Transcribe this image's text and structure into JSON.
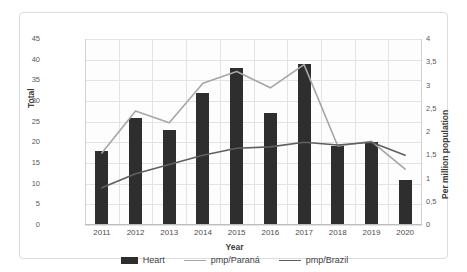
{
  "chart_data": {
    "type": "bar",
    "title": "",
    "xlabel": "Year",
    "ylabel": "Total",
    "y2label": "Per million population",
    "categories": [
      "2011",
      "2012",
      "2013",
      "2014",
      "2015",
      "2016",
      "2017",
      "2018",
      "2019",
      "2020"
    ],
    "ylim": [
      0,
      45
    ],
    "y2lim": [
      0,
      4
    ],
    "yticks": [
      "0",
      "5",
      "10",
      "15",
      "20",
      "25",
      "30",
      "35",
      "40",
      "45"
    ],
    "y2ticks": [
      "0",
      "0,5",
      "1",
      "1,5",
      "2",
      "2,5",
      "3",
      "3,5",
      "4"
    ],
    "grid": true,
    "legend_position": "bottom",
    "series": [
      {
        "name": "Heart",
        "type": "bar",
        "axis": "left",
        "color": "#2e2e2e",
        "values": [
          18,
          26,
          23,
          32,
          38,
          27,
          39,
          19,
          20,
          11
        ]
      },
      {
        "name": "pmp/Paraná",
        "type": "line",
        "axis": "right",
        "color": "#a6a6a6",
        "values": [
          1.55,
          2.45,
          2.2,
          3.05,
          3.3,
          2.95,
          3.45,
          1.7,
          1.8,
          1.2
        ]
      },
      {
        "name": "pmp/Brazil",
        "type": "line",
        "axis": "right",
        "color": "#5f5f5f",
        "values": [
          0.8,
          1.1,
          1.3,
          1.5,
          1.65,
          1.68,
          1.78,
          1.72,
          1.78,
          1.5
        ]
      }
    ]
  },
  "axes": {
    "left_title": "Total",
    "right_title": "Per million population",
    "x_title": "Year"
  },
  "legend": {
    "items": [
      {
        "label": "Heart",
        "marker": "bar-swatch",
        "color": "#2e2e2e"
      },
      {
        "label": "pmp/Paraná",
        "marker": "line-swatch",
        "color": "#a6a6a6"
      },
      {
        "label": "pmp/Brazil",
        "marker": "line-swatch",
        "color": "#5f5f5f"
      }
    ]
  },
  "colors": {
    "bar": "#2e2e2e",
    "parana_line": "#a6a6a6",
    "brazil_line": "#5f5f5f",
    "grid": "#e3e3e3",
    "border": "#dcdcdc"
  }
}
